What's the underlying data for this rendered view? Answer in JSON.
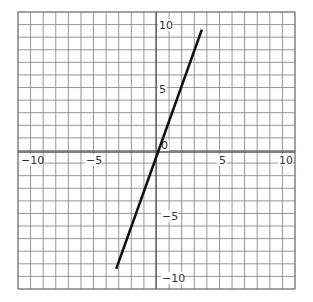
{
  "chart_data": {
    "type": "line",
    "title": "",
    "xlabel": "",
    "ylabel": "",
    "xlim": [
      -11,
      11
    ],
    "ylim": [
      -11,
      11
    ],
    "grid": true,
    "grid_step": 1,
    "x_ticks": [
      -10,
      -5,
      5,
      10
    ],
    "y_ticks": [
      -10,
      -5,
      5,
      10
    ],
    "origin_label": "0",
    "series": [
      {
        "name": "line",
        "x": [
          -3.2,
          3.6
        ],
        "y": [
          -9.4,
          9.6
        ],
        "color": "#111111"
      }
    ]
  },
  "labels": {
    "x_neg10": "−10",
    "x_neg5": "−5",
    "x_5": "5",
    "x_10": "10",
    "y_10": "10",
    "y_5": "5",
    "y_neg5": "−5",
    "y_neg10": "−10",
    "origin": "0"
  }
}
